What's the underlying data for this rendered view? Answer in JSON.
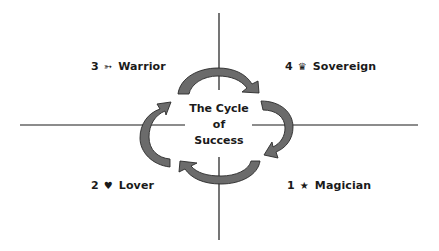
{
  "diagram": {
    "title_lines": [
      "The Cycle",
      "of",
      "Success"
    ],
    "quadrants": [
      {
        "position": "top-left",
        "number": "3",
        "symbol": "➳",
        "symbol_name": "arrow-icon",
        "label": "Warrior"
      },
      {
        "position": "top-right",
        "number": "4",
        "symbol": "♛",
        "symbol_name": "crown-icon",
        "label": "Sovereign"
      },
      {
        "position": "bottom-left",
        "number": "2",
        "symbol": "♥",
        "symbol_name": "heart-icon",
        "label": "Lover"
      },
      {
        "position": "bottom-right",
        "number": "1",
        "symbol": "★",
        "symbol_name": "star-icon",
        "label": "Magician"
      }
    ],
    "cycle_direction": "clockwise",
    "colors": {
      "arrow_fill": "#6b6b6b",
      "arrow_stroke": "#2a2a2a",
      "axis_line": "#1a1a1a",
      "text": "#1a1a1a",
      "background": "#ffffff"
    }
  }
}
